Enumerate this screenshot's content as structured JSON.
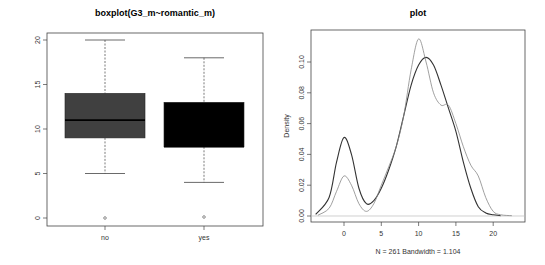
{
  "chart_data": [
    {
      "type": "box",
      "title": "boxplot(G3_m~romantic_m)",
      "xlabel": "",
      "ylabel": "",
      "ylim": [
        0,
        20
      ],
      "yticks": [
        "0",
        "5",
        "10",
        "15",
        "20"
      ],
      "categories": [
        "no",
        "yes"
      ],
      "boxes": [
        {
          "name": "no",
          "whisker_low": 5,
          "q1": 9,
          "median": 11,
          "q3": 14,
          "whisker_high": 20,
          "outliers": [
            0
          ],
          "fill": "#404040"
        },
        {
          "name": "yes",
          "whisker_low": 4,
          "q1": 8,
          "median": 8,
          "q3": 13,
          "whisker_high": 18,
          "outliers": [
            0
          ],
          "fill": "#000000"
        }
      ]
    },
    {
      "type": "line",
      "title": "plot",
      "xlabel": "N = 261   Bandwidth = 1.104",
      "ylabel": "Density",
      "xlim": [
        -4,
        23
      ],
      "ylim": [
        0,
        0.118
      ],
      "xticks": [
        "0",
        "5",
        "10",
        "15",
        "20"
      ],
      "yticks": [
        "0.00",
        "0.02",
        "0.04",
        "0.06",
        "0.08",
        "0.10"
      ],
      "series": [
        {
          "name": "density-dark",
          "color": "#333333",
          "x": [
            -3.8,
            -2,
            -1,
            0,
            1,
            2,
            3,
            4,
            5,
            6,
            7,
            8,
            9,
            10,
            11,
            12,
            13,
            14,
            15,
            16,
            17,
            18,
            19,
            20,
            21
          ],
          "y": [
            0.001,
            0.012,
            0.035,
            0.051,
            0.04,
            0.018,
            0.008,
            0.01,
            0.018,
            0.03,
            0.045,
            0.065,
            0.085,
            0.098,
            0.103,
            0.098,
            0.085,
            0.07,
            0.055,
            0.035,
            0.018,
            0.006,
            0.002,
            0.0008,
            0.0002
          ]
        },
        {
          "name": "density-light",
          "color": "#888888",
          "x": [
            -3.5,
            -2,
            -1,
            0,
            1,
            2,
            3,
            4,
            5,
            6,
            7,
            8,
            9,
            10,
            11,
            12,
            13,
            14,
            15,
            16,
            17,
            18,
            19,
            20,
            21,
            22.5
          ],
          "y": [
            0.0005,
            0.005,
            0.016,
            0.026,
            0.02,
            0.008,
            0.003,
            0.008,
            0.02,
            0.032,
            0.045,
            0.065,
            0.095,
            0.115,
            0.1,
            0.08,
            0.072,
            0.072,
            0.06,
            0.045,
            0.033,
            0.026,
            0.012,
            0.003,
            0.0008,
            0.0002
          ]
        }
      ]
    }
  ]
}
